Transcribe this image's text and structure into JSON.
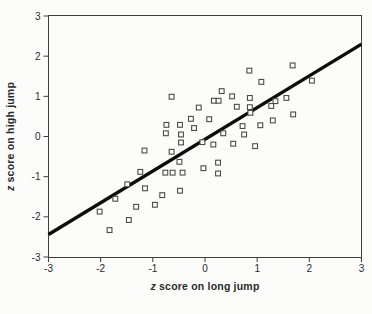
{
  "figure": {
    "xlabel_italic": "z",
    "xlabel_rest": " score on long jump",
    "ylabel_italic": "z",
    "ylabel_rest": " score on high jump"
  },
  "chart_data": {
    "type": "scatter",
    "title": "",
    "xlabel": "z score on long jump",
    "ylabel": "z score on high jump",
    "xlim": [
      -3,
      3
    ],
    "ylim": [
      -3,
      3
    ],
    "x_ticks": [
      -3,
      -2,
      -1,
      0,
      1,
      2,
      3
    ],
    "y_ticks": [
      -3,
      -2,
      -1,
      0,
      1,
      2,
      3
    ],
    "grid": false,
    "legend": "none",
    "marker": "open-square",
    "points": [
      [
        -2.02,
        -1.87
      ],
      [
        -1.83,
        -2.33
      ],
      [
        -1.46,
        -2.08
      ],
      [
        -1.32,
        -1.75
      ],
      [
        -1.72,
        -1.55
      ],
      [
        -1.49,
        -1.19
      ],
      [
        -1.15,
        -1.29
      ],
      [
        -0.96,
        -1.7
      ],
      [
        -0.82,
        -1.46
      ],
      [
        -0.48,
        -1.35
      ],
      [
        -1.16,
        -0.35
      ],
      [
        -1.24,
        -0.88
      ],
      [
        -0.76,
        -0.9
      ],
      [
        -0.62,
        -0.9
      ],
      [
        -0.43,
        -0.9
      ],
      [
        -0.64,
        -0.38
      ],
      [
        -0.49,
        -0.63
      ],
      [
        -0.03,
        -0.79
      ],
      [
        0.25,
        -0.65
      ],
      [
        0.25,
        -0.92
      ],
      [
        -0.46,
        -0.15
      ],
      [
        -0.05,
        -0.14
      ],
      [
        0.16,
        -0.2
      ],
      [
        0.54,
        -0.18
      ],
      [
        0.96,
        -0.24
      ],
      [
        0.35,
        0.08
      ],
      [
        0.75,
        0.05
      ],
      [
        -0.75,
        0.08
      ],
      [
        -0.46,
        0.05
      ],
      [
        -0.48,
        0.29
      ],
      [
        -0.74,
        0.29
      ],
      [
        -0.21,
        0.21
      ],
      [
        -0.27,
        0.44
      ],
      [
        0.08,
        0.43
      ],
      [
        0.72,
        0.26
      ],
      [
        1.06,
        0.28
      ],
      [
        1.3,
        0.4
      ],
      [
        1.69,
        0.55
      ],
      [
        0.87,
        0.59
      ],
      [
        0.86,
        0.73
      ],
      [
        0.86,
        0.96
      ],
      [
        0.61,
        0.74
      ],
      [
        0.17,
        0.89
      ],
      [
        0.26,
        0.89
      ],
      [
        0.52,
        1.0
      ],
      [
        0.32,
        1.13
      ],
      [
        -0.12,
        0.72
      ],
      [
        -0.64,
        0.99
      ],
      [
        1.27,
        0.76
      ],
      [
        1.35,
        0.88
      ],
      [
        1.56,
        0.96
      ],
      [
        1.08,
        1.36
      ],
      [
        0.85,
        1.64
      ],
      [
        1.68,
        1.77
      ],
      [
        2.05,
        1.39
      ]
    ],
    "regression_line": {
      "x1": -3,
      "y1": -2.44,
      "x2": 3,
      "y2": 2.3
    },
    "colors": {
      "background": "#fcfcfa",
      "frame": "#3d3d3d",
      "tick": "#3d3d3d",
      "text": "#2a2a2a",
      "marker_stroke": "#4a4a4a",
      "marker_fill": "#ffffff",
      "line": "#0c0c0c"
    }
  }
}
